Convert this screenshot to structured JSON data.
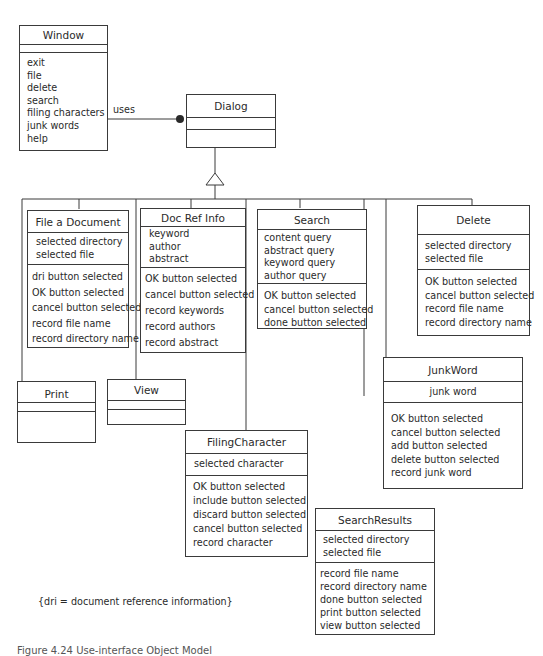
{
  "diagram": {
    "type": "UML class diagram",
    "association": {
      "label": "uses",
      "from": "Window",
      "to": "Dialog"
    },
    "generalization": {
      "parent": "Dialog",
      "children": [
        "File a Document",
        "Doc Ref Info",
        "Search",
        "Delete",
        "Print",
        "View",
        "FilingCharacter",
        "JunkWord",
        "SearchResults"
      ]
    },
    "note": "{dri = document reference information}",
    "caption": "Figure 4.24  Use-interface Object Model"
  },
  "classes": {
    "window": {
      "name": "Window",
      "attributes": [],
      "operations": [
        "exit",
        "file",
        "delete",
        "search",
        "filing characters",
        "junk words",
        "help"
      ]
    },
    "dialog": {
      "name": "Dialog",
      "attributes": [],
      "operations": []
    },
    "file_document": {
      "name": "File a Document",
      "attributes": [
        "selected directory",
        "selected file"
      ],
      "operations": [
        "dri button selected",
        "OK button selected",
        "cancel button selected",
        "record file name",
        "record directory name"
      ]
    },
    "doc_ref_info": {
      "name": "Doc Ref Info",
      "attributes": [
        "keyword",
        "author",
        "abstract"
      ],
      "operations": [
        "OK button selected",
        "cancel button selected",
        "record keywords",
        "record authors",
        "record abstract"
      ]
    },
    "search": {
      "name": "Search",
      "attributes": [
        "content query",
        "abstract query",
        "keyword query",
        "author query"
      ],
      "operations": [
        "OK button selected",
        "cancel button selected",
        "done button selected"
      ]
    },
    "delete": {
      "name": "Delete",
      "attributes": [
        "selected directory",
        "selected file"
      ],
      "operations": [
        "OK button selected",
        "cancel button selected",
        "record file name",
        "record directory name"
      ]
    },
    "print": {
      "name": "Print",
      "attributes": [],
      "operations": []
    },
    "view": {
      "name": "View",
      "attributes": [],
      "operations": []
    },
    "filing_character": {
      "name": "FilingCharacter",
      "attributes": [
        "selected character"
      ],
      "operations": [
        "OK button selected",
        "include button selected",
        "discard button selected",
        "cancel button selected",
        "record character"
      ]
    },
    "junk_word": {
      "name": "JunkWord",
      "attributes": [
        "junk word"
      ],
      "operations": [
        "OK button selected",
        "cancel button selected",
        "add button selected",
        "delete button selected",
        "record junk word"
      ]
    },
    "search_results": {
      "name": "SearchResults",
      "attributes": [
        "selected directory",
        "selected file"
      ],
      "operations": [
        "record file name",
        "record directory name",
        "done button selected",
        "print button selected",
        "view button selected"
      ]
    }
  }
}
